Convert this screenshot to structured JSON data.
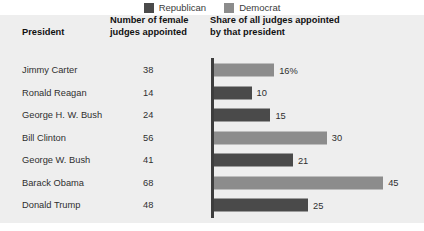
{
  "legend": {
    "items": [
      {
        "label": "Republican",
        "color": "#4a4a4a",
        "icon": "square-swatch-icon"
      },
      {
        "label": "Democrat",
        "color": "#8c8c8c",
        "icon": "square-swatch-icon"
      }
    ]
  },
  "table": {
    "headers": {
      "president": "President",
      "number_line1": "Number of female",
      "number_line2": "judges appointed",
      "share_line1": "Share of all judges appointed",
      "share_line2": "by that president"
    }
  },
  "colors": {
    "republican": "#4a4a4a",
    "democrat": "#8c8c8c",
    "panel_bg": "#eeeeee",
    "axis": "#3d3d3d",
    "text": "#2f2f2f",
    "heading": "#111111"
  },
  "chart_data": {
    "type": "bar",
    "title": "Share of all judges appointed by that president",
    "xlabel": "",
    "ylabel": "President",
    "orientation": "horizontal",
    "grid": false,
    "legend_position": "top-center",
    "xlim": [
      0,
      50
    ],
    "categories": [
      "Jimmy Carter",
      "Ronald Reagan",
      "George H. W. Bush",
      "Bill Clinton",
      "George W. Bush",
      "Barack Obama",
      "Donald Trump"
    ],
    "series": [
      {
        "name": "Number of female judges appointed",
        "values": [
          38,
          14,
          24,
          56,
          41,
          68,
          48
        ]
      },
      {
        "name": "Share of all judges appointed by that president",
        "values": [
          16,
          10,
          15,
          30,
          21,
          45,
          25
        ]
      }
    ],
    "rows": [
      {
        "president": "Jimmy Carter",
        "count": "38",
        "share": 16,
        "share_label": "16%",
        "party": "Democrat"
      },
      {
        "president": "Ronald Reagan",
        "count": "14",
        "share": 10,
        "share_label": "10",
        "party": "Republican"
      },
      {
        "president": "George H. W. Bush",
        "count": "24",
        "share": 15,
        "share_label": "15",
        "party": "Republican"
      },
      {
        "president": "Bill Clinton",
        "count": "56",
        "share": 30,
        "share_label": "30",
        "party": "Democrat"
      },
      {
        "president": "George W. Bush",
        "count": "41",
        "share": 21,
        "share_label": "21",
        "party": "Republican"
      },
      {
        "president": "Barack Obama",
        "count": "68",
        "share": 45,
        "share_label": "45",
        "party": "Democrat"
      },
      {
        "president": "Donald Trump",
        "count": "48",
        "share": 25,
        "share_label": "25",
        "party": "Republican"
      }
    ]
  }
}
